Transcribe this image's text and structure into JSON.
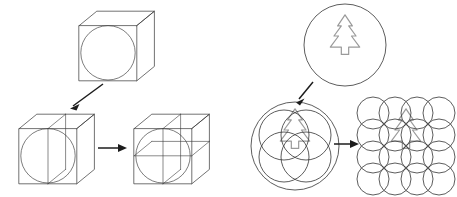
{
  "figure": {
    "title": "Hierarchical bounding volume subdivision diagram",
    "background_color": "#ffffff",
    "width": 457,
    "height": 197,
    "colors": {
      "outline_dark": "#3a3a3a",
      "circle_stroke": "#404040",
      "shape_gray": "#9a9a9a",
      "arrow": "#1c1c1c"
    },
    "panels": [
      {
        "id": "left-panel",
        "caption": "",
        "description": "Cube bounding volume progressively split by mid-planes",
        "steps": [
          {
            "id": "left-step-1",
            "label": "",
            "shape": "cube-with-inscribed-sphere",
            "subdivision_count": 1,
            "planes": []
          },
          {
            "id": "left-step-2",
            "label": "",
            "shape": "cube-with-inscribed-sphere",
            "subdivision_count": 2,
            "planes": [
              "vertical"
            ]
          },
          {
            "id": "left-step-3",
            "label": "",
            "shape": "cube-with-inscribed-sphere",
            "subdivision_count": 4,
            "planes": [
              "vertical",
              "horizontal"
            ]
          }
        ],
        "arrows": [
          {
            "id": "left-arrow-diagonal",
            "from": "left-step-1",
            "to": "left-step-2",
            "direction": "down-left",
            "label": ""
          },
          {
            "id": "left-arrow-horizontal",
            "from": "left-step-2",
            "to": "left-step-3",
            "direction": "right",
            "label": ""
          }
        ]
      },
      {
        "id": "right-panel",
        "caption": "",
        "description": "Tree silhouette covered by progressively finer circle packings",
        "steps": [
          {
            "id": "right-step-1",
            "label": "",
            "shape": "tree-in-single-circle",
            "circle_count": 1,
            "grid": "1x1"
          },
          {
            "id": "right-step-2",
            "label": "",
            "shape": "tree-in-circle-cluster",
            "circle_count": 5,
            "grid": "2x2 plus enclosing"
          },
          {
            "id": "right-step-3",
            "label": "",
            "shape": "tree-in-circle-grid",
            "circle_count": 16,
            "grid": "4x4"
          }
        ],
        "arrows": [
          {
            "id": "right-arrow-diagonal",
            "from": "right-step-1",
            "to": "right-step-2",
            "direction": "down",
            "label": ""
          },
          {
            "id": "right-arrow-horizontal",
            "from": "right-step-2",
            "to": "right-step-3",
            "direction": "right",
            "label": ""
          }
        ],
        "motif": {
          "id": "tree-motif",
          "name": "evergreen-tree",
          "tiers": 3,
          "has_trunk": true,
          "stroke_color": "#9a9a9a"
        }
      }
    ]
  }
}
